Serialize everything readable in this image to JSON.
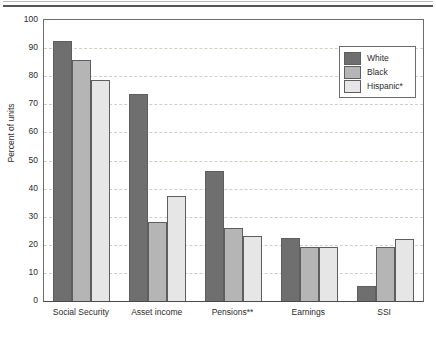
{
  "chart_data": {
    "type": "bar",
    "title": "",
    "subtitle": "",
    "xlabel": "",
    "ylabel": "Percent of units",
    "ylim": [
      0,
      100
    ],
    "ytick_step": 10,
    "yticks": [
      "100",
      "90",
      "80",
      "70",
      "60",
      "50",
      "40",
      "30",
      "20",
      "10",
      "0"
    ],
    "grid": "horizontal-dashed",
    "legend_position": "top-right-inside",
    "categories": [
      "Social Security",
      "Asset income",
      "Pensions**",
      "Earnings",
      "SSI"
    ],
    "series": [
      {
        "name": "White",
        "color": "#6f6f6f",
        "values": [
          92.5,
          73.8,
          46.4,
          22.3,
          5.5
        ]
      },
      {
        "name": "Black",
        "color": "#b5b5b5",
        "values": [
          85.6,
          28.2,
          26.0,
          19.2,
          19.4
        ]
      },
      {
        "name": "Hispanic*",
        "color": "#e6e6e6",
        "values": [
          78.5,
          37.5,
          23.3,
          19.1,
          22.1
        ]
      }
    ]
  },
  "axis": {
    "y_title": "Percent of units"
  },
  "legend": {
    "entries": [
      {
        "label": "White"
      },
      {
        "label": "Black"
      },
      {
        "label": "Hispanic*"
      }
    ]
  },
  "colors": {
    "series_white": "#6f6f6f",
    "series_black": "#b5b5b5",
    "series_hispanic": "#e6e6e6",
    "axis": "#4a4a4a",
    "gridline": "#cfcfc8",
    "rule": "#555555"
  }
}
